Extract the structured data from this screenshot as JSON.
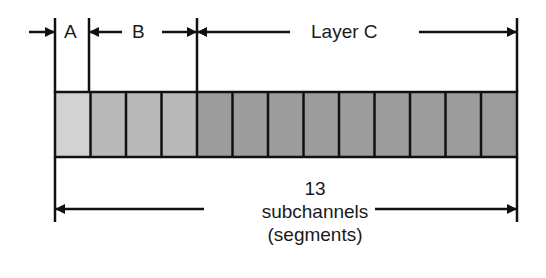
{
  "layers": [
    {
      "id": "A",
      "label": "A",
      "segments": 1,
      "color": "#d2d2d2"
    },
    {
      "id": "B",
      "label": "B",
      "segments": 3,
      "color": "#b9b9b9"
    },
    {
      "id": "C",
      "label": "Layer C",
      "segments": 9,
      "color": "#9c9c9c"
    }
  ],
  "total": {
    "count": "13",
    "line1": "subchannels",
    "line2": "(segments)"
  },
  "colors": {
    "stroke": "#111111",
    "background": "#ffffff"
  }
}
